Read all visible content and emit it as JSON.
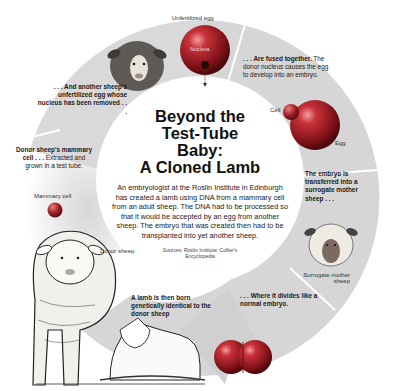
{
  "title": "Beyond the Test-Tube Baby: A Cloned Lamb",
  "title_lines": [
    "Beyond the",
    "Test-Tube",
    "Baby:",
    "A Cloned Lamb"
  ],
  "description": "An embryologist at the Roslin Institute in Edinburgh has created a lamb using DNA from a mammary cell from an adult sheep. The DNA had to be processed so that it would be accepted by an egg from another sheep. The embryo that was created then had to be transplanted into yet another sheep.",
  "sources": "Sources: Roslin Institute; Collier's Encyclopedia",
  "steps": [
    {
      "id": "donor-cell",
      "bold": "Donor sheep's mammary cell . . .",
      "text": "Extracted and grown in a test tube."
    },
    {
      "id": "unfertilized-egg",
      "bold": ". . . And another sheep's unfertilized egg whose nucleus has been removed . . .",
      "text": ""
    },
    {
      "id": "fusion",
      "bold": ". . . Are fused together.",
      "text": "The donor nucleus causes the egg to develop into an embryo."
    },
    {
      "id": "transfer",
      "bold": "The embryo is transferred into a surrogate mother sheep . . .",
      "text": ""
    },
    {
      "id": "division",
      "bold": ". . . Where it divides like a normal embryo.",
      "text": ""
    },
    {
      "id": "birth",
      "bold": "A lamb is then born genetically identical to the donor sheep",
      "text": ""
    }
  ],
  "labels": {
    "unfertilized_egg": "Unfertilized egg",
    "nucleus": "Nucleus",
    "cell": "Cell",
    "egg": "Egg",
    "mammary_cell": "Mammary cell",
    "donor_sheep": "Donor sheep",
    "surrogate_mother": "Surrogate mother sheep"
  },
  "colors": {
    "ring": "#d6d6d6",
    "ring_divider": "#ffffff",
    "egg_red": "#b8202a",
    "background": "#ffffff"
  }
}
